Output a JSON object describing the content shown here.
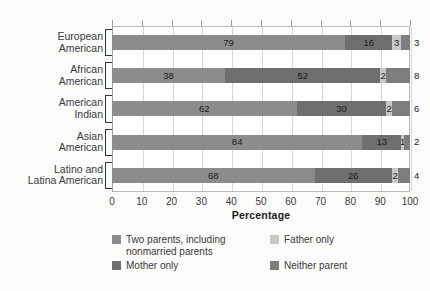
{
  "chart_data": {
    "type": "bar",
    "orientation": "horizontal",
    "stacked": true,
    "title": "",
    "xlabel": "Percentage",
    "ylabel": "",
    "xlim": [
      0,
      100
    ],
    "xticks": [
      "0",
      "10",
      "20",
      "30",
      "40",
      "50",
      "60",
      "70",
      "80",
      "90",
      "100"
    ],
    "grid": true,
    "legend_position": "bottom",
    "categories": [
      "European\nAmerican",
      "African\nAmerican",
      "American\nIndian",
      "Asian\nAmerican",
      "Latino and\nLatina American"
    ],
    "series": [
      {
        "name": "Two parents, including\nnonmarried parents",
        "color": "#8c8c8c",
        "values": [
          79,
          38,
          62,
          84,
          68
        ]
      },
      {
        "name": "Mother only",
        "color": "#6f6f6f",
        "values": [
          16,
          52,
          30,
          13,
          26
        ]
      },
      {
        "name": "Father only",
        "color": "#c8c8c8",
        "values": [
          3,
          2,
          2,
          1,
          2
        ]
      },
      {
        "name": "Neither parent",
        "color": "#7d7d7d",
        "values": [
          3,
          8,
          6,
          2,
          4
        ]
      }
    ],
    "data_labels": [
      [
        "79",
        "16",
        "3",
        "3"
      ],
      [
        "38",
        "52",
        "2",
        "8"
      ],
      [
        "62",
        "30",
        "2",
        "6"
      ],
      [
        "84",
        "13",
        "1",
        "2"
      ],
      [
        "68",
        "26",
        "2",
        "4"
      ]
    ]
  },
  "legend": {
    "items": [
      {
        "label": "Two parents, including\nnonmarried parents",
        "color": "#8c8c8c"
      },
      {
        "label": "Father only",
        "color": "#c8c8c8"
      },
      {
        "label": "Mother only",
        "color": "#6f6f6f"
      },
      {
        "label": "Neither parent",
        "color": "#7d7d7d"
      }
    ]
  }
}
